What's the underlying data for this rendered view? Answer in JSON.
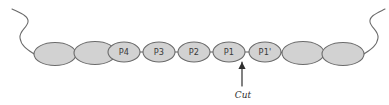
{
  "figure": {
    "background_color": "#ffffff",
    "width": 389,
    "height": 105
  },
  "style": {
    "residue_fill": "#d2d2d2",
    "residue_stroke": "#6b6b6b",
    "chain_stroke": "#6b6b6b",
    "arrow_color": "#2e2e2e",
    "label_color": "#3a3a3a"
  },
  "chain": {
    "name": "peptide-substrate-chain",
    "residues": [
      {
        "id": "res-left-2",
        "label": "",
        "cx": 55,
        "cy": 54,
        "rx": 21,
        "ry": 11.5,
        "labeled": false
      },
      {
        "id": "res-left-1",
        "label": "",
        "cx": 95,
        "cy": 53,
        "rx": 21,
        "ry": 11.5,
        "labeled": false
      },
      {
        "id": "res-p4",
        "label": "P4",
        "cx": 124,
        "cy": 52,
        "rx": 16,
        "ry": 10,
        "labeled": true
      },
      {
        "id": "res-p3",
        "label": "P3",
        "cx": 159,
        "cy": 52,
        "rx": 16,
        "ry": 10,
        "labeled": true
      },
      {
        "id": "res-p2",
        "label": "P2",
        "cx": 194,
        "cy": 52,
        "rx": 16,
        "ry": 10,
        "labeled": true
      },
      {
        "id": "res-p1",
        "label": "P1",
        "cx": 229,
        "cy": 52,
        "rx": 16,
        "ry": 10,
        "labeled": true
      },
      {
        "id": "res-p1prime",
        "label": "P1'",
        "cx": 265,
        "cy": 52,
        "rx": 16,
        "ry": 10,
        "labeled": true
      },
      {
        "id": "res-right-1",
        "label": "",
        "cx": 303,
        "cy": 53,
        "rx": 21,
        "ry": 11.5,
        "labeled": false
      },
      {
        "id": "res-right-2",
        "label": "",
        "cx": 343,
        "cy": 54,
        "rx": 21,
        "ry": 11.5,
        "labeled": false
      }
    ],
    "linkers": [
      {
        "id": "link-1",
        "x1": 76,
        "y1": 54,
        "x2": 74,
        "y2": 53
      },
      {
        "id": "link-2",
        "x1": 116,
        "y1": 53,
        "x2": 108,
        "y2": 52
      },
      {
        "id": "link-3",
        "x1": 140,
        "y1": 52,
        "x2": 143,
        "y2": 52
      },
      {
        "id": "link-4",
        "x1": 175,
        "y1": 52,
        "x2": 178,
        "y2": 52
      },
      {
        "id": "link-5",
        "x1": 210,
        "y1": 52,
        "x2": 213,
        "y2": 52
      },
      {
        "id": "link-6",
        "x1": 245,
        "y1": 52,
        "x2": 249,
        "y2": 52
      },
      {
        "id": "link-7",
        "x1": 281,
        "y1": 52,
        "x2": 282,
        "y2": 53
      },
      {
        "id": "link-8",
        "x1": 324,
        "y1": 53,
        "x2": 322,
        "y2": 54
      }
    ],
    "left_tail_path": "M 34 54 C 28 50, 21 46, 20 38 C 19 31, 27 28, 28 22 C 29 16, 20 13, 12 9",
    "right_tail_path": "M 364 54 C 370 50, 377 46, 378 38 C 379 31, 371 28, 370 22 C 369 16, 377 13, 385 9"
  },
  "annotation": {
    "cut_label": "Cut",
    "arrow_name": "cleavage-site-arrow",
    "arrow_x": 242,
    "arrow_top_y": 62,
    "arrow_bottom_y": 86,
    "label_x": 243,
    "label_y": 95
  }
}
